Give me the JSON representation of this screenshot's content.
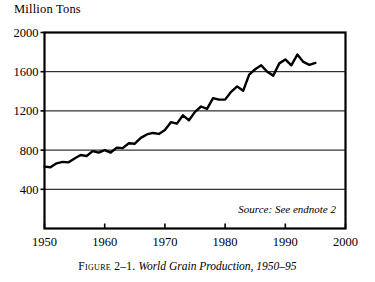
{
  "figure": {
    "axis_title": "Million Tons",
    "source_note": "Source: See endnote 2",
    "caption_label": "Figure 2–1.",
    "caption_title": "World Grain Production, 1950–95"
  },
  "chart_data": {
    "type": "line",
    "title": "World Grain Production, 1950–95",
    "xlabel": "",
    "ylabel": "Million Tons",
    "xlim": [
      1950,
      2000
    ],
    "ylim": [
      0,
      2000
    ],
    "yticks": [
      400,
      800,
      1200,
      1600,
      2000
    ],
    "xticks": [
      1950,
      1960,
      1970,
      1980,
      1990,
      2000
    ],
    "grid": "horizontal",
    "legend": "none",
    "line_color": "#000000",
    "series": [
      {
        "name": "World grain production",
        "x": [
          1950,
          1951,
          1952,
          1953,
          1954,
          1955,
          1956,
          1957,
          1958,
          1959,
          1960,
          1961,
          1962,
          1963,
          1964,
          1965,
          1966,
          1967,
          1968,
          1969,
          1970,
          1971,
          1972,
          1973,
          1974,
          1975,
          1976,
          1977,
          1978,
          1979,
          1980,
          1981,
          1982,
          1983,
          1984,
          1985,
          1986,
          1987,
          1988,
          1989,
          1990,
          1991,
          1992,
          1993,
          1994,
          1995
        ],
        "values": [
          631,
          625,
          665,
          680,
          675,
          715,
          750,
          740,
          790,
          775,
          800,
          775,
          825,
          820,
          870,
          865,
          925,
          960,
          975,
          965,
          1005,
          1085,
          1070,
          1155,
          1105,
          1190,
          1245,
          1220,
          1330,
          1315,
          1315,
          1395,
          1450,
          1405,
          1570,
          1625,
          1665,
          1600,
          1560,
          1685,
          1725,
          1665,
          1775,
          1700,
          1670,
          1690
        ]
      }
    ]
  }
}
